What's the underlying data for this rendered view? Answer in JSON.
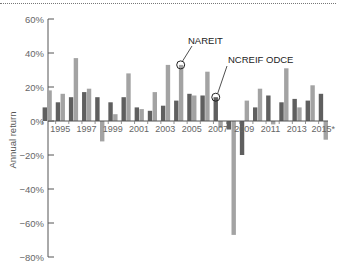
{
  "chart_data": {
    "type": "bar",
    "title": "",
    "xlabel": "",
    "ylabel": "Annual return",
    "ylim": [
      -80,
      60
    ],
    "yticks": [
      "60%",
      "40%",
      "20%",
      "0%",
      "-20%",
      "-40%",
      "-60%",
      "-80%"
    ],
    "ytick_values": [
      60,
      40,
      20,
      0,
      -20,
      -40,
      -60,
      -80
    ],
    "xtick_labels": [
      "1995",
      "1997",
      "1999",
      "2001",
      "2003",
      "2005",
      "2007",
      "2009",
      "2011",
      "2013",
      "2015*"
    ],
    "categories": [
      "1994",
      "1995",
      "1996",
      "1997",
      "1998",
      "1999",
      "2000",
      "2001",
      "2002",
      "2003",
      "2004",
      "2005",
      "2006",
      "2007",
      "2008",
      "2009",
      "2010",
      "2011",
      "2012",
      "2013",
      "2014",
      "2015*"
    ],
    "series": [
      {
        "name": "NCREIF ODCE",
        "color": "#5f5f5f",
        "values": [
          8,
          11,
          14,
          17,
          14,
          11,
          14,
          8,
          6,
          9,
          12,
          16,
          15,
          14,
          -5,
          -20,
          8,
          15,
          11,
          13,
          12,
          16
        ]
      },
      {
        "name": "NAREIT",
        "color": "#a3a3a3",
        "values": [
          18,
          16,
          37,
          19,
          -12,
          4,
          28,
          7,
          17,
          33,
          33,
          15,
          29,
          -4,
          -67,
          12,
          19,
          -2,
          31,
          8,
          21,
          -11
        ]
      }
    ],
    "annotations": [
      {
        "text": "NAREIT",
        "points_to": "2004 NAREIT bar"
      },
      {
        "text": "NCREIF ODCE",
        "points_to": "2007 NCREIF ODCE bar"
      }
    ],
    "grid": false,
    "legend_position": "inline annotations"
  },
  "labels": {
    "ylabel": "Annual return",
    "annot_nareit": "NAREIT",
    "annot_odce": "NCREIF ODCE"
  }
}
